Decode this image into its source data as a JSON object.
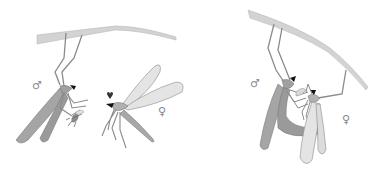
{
  "figure": {
    "panels": [
      {
        "id": "left",
        "description": "Male hangingfly hanging from branch holding prey insect, approaching female",
        "labels": {
          "male_symbol": "♂",
          "female_symbol": "♀"
        }
      },
      {
        "id": "right",
        "description": "Male and female hanging from branch while mating, female feeding on nuptial gift",
        "labels": {
          "male_symbol": "♂",
          "female_symbol": "♀"
        }
      }
    ],
    "colors": {
      "branch": "#d3d3d3",
      "branch_edge": "#b8b8b8",
      "male_wing": "#9a9a9a",
      "female_wing": "#e4e4e4",
      "leg": "#8a8a8a",
      "head": "#111111",
      "symbol": "#8a8a8a"
    }
  }
}
